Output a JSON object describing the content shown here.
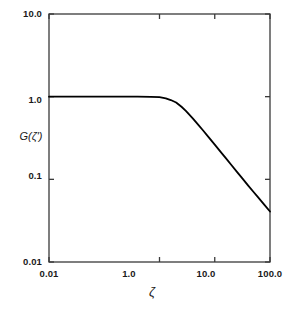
{
  "chart_data": {
    "type": "line",
    "title": "",
    "subtitle": "",
    "xlabel": "ζ",
    "ylabel": "G(ζ')",
    "xscale": "log",
    "yscale": "log",
    "xlim": [
      0.01,
      100.0
    ],
    "ylim": [
      0.01,
      10.0
    ],
    "grid": false,
    "legend": null,
    "x_tick_labels": [
      "0.01",
      "1.0",
      "10.0",
      "100.0"
    ],
    "x_tick_values": [
      0.01,
      1.0,
      10.0,
      100.0
    ],
    "y_tick_labels": [
      "10.0",
      "1.0",
      "0.1",
      "0.01"
    ],
    "y_tick_values": [
      10.0,
      1.0,
      0.1,
      0.01
    ],
    "series": [
      {
        "name": "G(ζ')",
        "color": "#000000",
        "linewidth": 1.8,
        "x": [
          0.01,
          0.02,
          0.05,
          0.1,
          0.2,
          0.4,
          0.7,
          1.0,
          1.3,
          1.6,
          2.0,
          2.5,
          3.0,
          4.0,
          5.0,
          6.0,
          8.0,
          10.0,
          13.0,
          16.0,
          20.0,
          25.0,
          30.0,
          40.0,
          50.0,
          60.0,
          80.0,
          100.0
        ],
        "y": [
          1.0,
          1.0,
          1.0,
          1.0,
          1.0,
          1.0,
          0.995,
          0.985,
          0.955,
          0.91,
          0.85,
          0.755,
          0.672,
          0.545,
          0.459,
          0.398,
          0.315,
          0.263,
          0.212,
          0.179,
          0.149,
          0.124,
          0.107,
          0.0845,
          0.0707,
          0.0613,
          0.0487,
          0.0408
        ]
      }
    ],
    "annotations": []
  },
  "axes": {
    "frame_color": "#3a3a3a",
    "plot_left_px": 49,
    "plot_right_px": 270,
    "plot_top_px": 14,
    "plot_bottom_px": 262
  },
  "y_ticks": [
    {
      "label": "10.0",
      "top_px": 8
    },
    {
      "label": "1.0",
      "top_px": 94
    },
    {
      "label": "0.1",
      "top_px": 170
    },
    {
      "label": "0.01",
      "top_px": 256
    }
  ],
  "x_ticks": [
    {
      "label": "0.01",
      "left_px": 29,
      "width_px": 40
    },
    {
      "label": "1.0",
      "left_px": 111,
      "width_px": 36
    },
    {
      "label": "10.0",
      "left_px": 186,
      "width_px": 40
    },
    {
      "label": "100.0",
      "left_px": 248,
      "width_px": 44
    }
  ],
  "titles": {
    "y_axis": "G(ζ')",
    "x_axis": "ζ"
  }
}
